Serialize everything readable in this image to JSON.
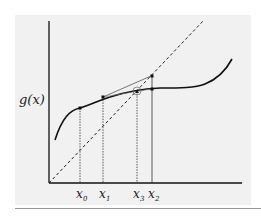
{
  "figure": {
    "y_label": "g(x)",
    "x_labels": [
      {
        "id": "x0",
        "base": "x",
        "sub": "0"
      },
      {
        "id": "x1",
        "base": "x",
        "sub": "1"
      },
      {
        "id": "x3",
        "base": "x",
        "sub": "3"
      },
      {
        "id": "x2",
        "base": "x",
        "sub": "2"
      }
    ],
    "elements": [
      "curve g(x)",
      "dashed line y = x",
      "vertical dotted projections",
      "secant line",
      "fixed point circle"
    ]
  }
}
